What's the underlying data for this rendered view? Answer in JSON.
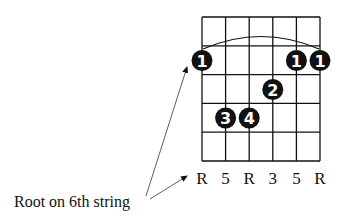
{
  "diagram": {
    "type": "guitar-chord-diagram",
    "strings": 6,
    "frets_shown": 5,
    "barre": {
      "fret": 1,
      "from_string": 1,
      "to_string": 6
    },
    "fingers": [
      {
        "string": 1,
        "fret": 1,
        "label": "1"
      },
      {
        "string": 5,
        "fret": 1,
        "label": "1"
      },
      {
        "string": 6,
        "fret": 1,
        "label": "1"
      },
      {
        "string": 4,
        "fret": 2,
        "label": "2"
      },
      {
        "string": 2,
        "fret": 3,
        "label": "3"
      },
      {
        "string": 3,
        "fret": 3,
        "label": "4"
      }
    ],
    "string_labels": [
      "R",
      "5",
      "R",
      "3",
      "5",
      "R"
    ],
    "annotation": "Root on 6th string",
    "colors": {
      "ink": "#111111",
      "dot_text": "#ffffff",
      "background": "#ffffff"
    }
  }
}
